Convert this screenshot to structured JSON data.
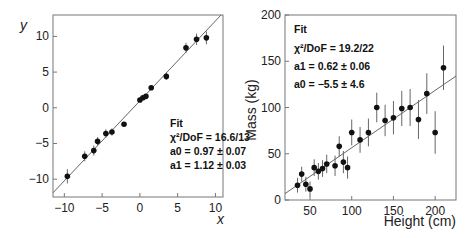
{
  "chart_data": [
    {
      "type": "scatter",
      "title": "",
      "xlabel": "x",
      "ylabel": "y",
      "xlim": [
        -11.5,
        11
      ],
      "ylim": [
        -12.5,
        13
      ],
      "xticks": [
        -10,
        -5,
        0,
        5,
        10
      ],
      "yticks": [
        -10,
        -5,
        0,
        5,
        10
      ],
      "grid": false,
      "points": [
        {
          "x": -9.6,
          "y": -9.6,
          "err": 1.0
        },
        {
          "x": -7.3,
          "y": -6.8,
          "err": 0.7
        },
        {
          "x": -6.1,
          "y": -6.0,
          "err": 0.7
        },
        {
          "x": -5.6,
          "y": -4.7,
          "err": 0.6
        },
        {
          "x": -4.5,
          "y": -3.6,
          "err": 0.6
        },
        {
          "x": -3.7,
          "y": -3.4,
          "err": 0.5
        },
        {
          "x": -2.1,
          "y": -2.3,
          "err": 0.3
        },
        {
          "x": 0.0,
          "y": 1.1,
          "err": 0.3
        },
        {
          "x": 0.4,
          "y": 1.4,
          "err": 0.3
        },
        {
          "x": 0.8,
          "y": 1.6,
          "err": 0.3
        },
        {
          "x": 1.5,
          "y": 2.8,
          "err": 0.3
        },
        {
          "x": 3.5,
          "y": 4.4,
          "err": 0.5
        },
        {
          "x": 6.1,
          "y": 8.4,
          "err": 0.7
        },
        {
          "x": 7.5,
          "y": 9.6,
          "err": 0.8
        },
        {
          "x": 8.8,
          "y": 9.8,
          "err": 0.9
        }
      ],
      "fit_line": {
        "a0": 0.97,
        "a1": 1.12
      },
      "annotation": {
        "title": "Fit",
        "chi2": "χ²/DoF = 16.6/13",
        "a0": "a0 = 0.97 ± 0.07",
        "a1": "a1 = 1.12 ± 0.03"
      }
    },
    {
      "type": "scatter",
      "title": "",
      "xlabel": "Height (cm)",
      "ylabel": "Mass (kg)",
      "xlim": [
        20,
        225
      ],
      "ylim": [
        0,
        200
      ],
      "xticks": [
        50,
        100,
        150,
        200
      ],
      "yticks": [
        0,
        50,
        100,
        150,
        200
      ],
      "grid": false,
      "points": [
        {
          "x": 35,
          "y": 16,
          "err": 8
        },
        {
          "x": 40,
          "y": 28,
          "err": 8
        },
        {
          "x": 45,
          "y": 17,
          "err": 8
        },
        {
          "x": 50,
          "y": 12,
          "err": 8
        },
        {
          "x": 55,
          "y": 35,
          "err": 9
        },
        {
          "x": 60,
          "y": 31,
          "err": 9
        },
        {
          "x": 65,
          "y": 34,
          "err": 9
        },
        {
          "x": 70,
          "y": 39,
          "err": 10
        },
        {
          "x": 80,
          "y": 37,
          "err": 11
        },
        {
          "x": 85,
          "y": 58,
          "err": 11
        },
        {
          "x": 90,
          "y": 41,
          "err": 12
        },
        {
          "x": 95,
          "y": 35,
          "err": 12
        },
        {
          "x": 100,
          "y": 73,
          "err": 14
        },
        {
          "x": 110,
          "y": 65,
          "err": 14
        },
        {
          "x": 120,
          "y": 73,
          "err": 15
        },
        {
          "x": 130,
          "y": 100,
          "err": 16
        },
        {
          "x": 140,
          "y": 86,
          "err": 17
        },
        {
          "x": 150,
          "y": 89,
          "err": 18
        },
        {
          "x": 160,
          "y": 99,
          "err": 19
        },
        {
          "x": 170,
          "y": 100,
          "err": 20
        },
        {
          "x": 180,
          "y": 87,
          "err": 21
        },
        {
          "x": 190,
          "y": 115,
          "err": 22
        },
        {
          "x": 200,
          "y": 73,
          "err": 23
        },
        {
          "x": 210,
          "y": 143,
          "err": 24
        }
      ],
      "fit_line": {
        "a0": -5.5,
        "a1": 0.62
      },
      "annotation": {
        "title": "Fit",
        "chi2": "χ²/DoF = 19.2/22",
        "a1": "a1 = 0.62 ± 0.06",
        "a0": "a0 = −5.5 ± 4.6"
      }
    }
  ]
}
